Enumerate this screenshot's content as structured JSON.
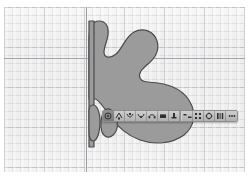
{
  "app": {
    "kind": "vector-drawing-canvas",
    "background_color": "#ffffff",
    "canvas_color": "#eeeeee"
  },
  "canvas": {
    "grid": {
      "visible": true,
      "minor_spacing_px": 8,
      "major_spacing_px": 40,
      "minor_color": "#b0b4ba",
      "major_color": "#9ea3aa"
    },
    "guides": [
      {
        "name": "vertical-guide",
        "orientation": "vertical",
        "position_px": 82,
        "color": "#9a9ea4"
      },
      {
        "name": "horizontal-guide",
        "orientation": "horizontal",
        "position_px": 51,
        "color": "#a2a6ac"
      }
    ]
  },
  "artwork": {
    "name": "blob-shape",
    "description": "large organic multi-lobed blob",
    "fill_color": "#9b9b9b",
    "stroke_color": "#4a4a4a",
    "stroke_width": 1.2,
    "selected": true,
    "path": "M 85 33 C 85 22, 88 14, 95 14 C 102 14, 105 20, 104 28 C 103 35, 100 40, 100 45 C 100 51, 106 52, 112 47 C 119 41, 121 30, 130 25 C 139 20, 150 24, 153 34 C 156 44, 150 52, 144 57 C 138 62, 134 66, 136 71 C 138 76, 146 75, 154 76 C 168 78, 180 84, 186 95 C 193 107, 190 120, 180 128 C 168 137, 150 138, 136 133 C 122 128, 112 118, 105 108 C 99 99, 94 92, 91 92 L 85 92 Z",
    "lobes": [
      {
        "name": "lower-lobe-left",
        "path": "M 85 108 C 85 104, 86 101, 89 101 C 93 101, 96 107, 96 115 C 96 126, 93 133, 89 133 C 86 133, 85 129, 85 124 Z"
      },
      {
        "name": "lower-lobe-right",
        "path": "M 99 107 C 102 103, 107 104, 110 109 C 114 116, 113 125, 108 129 C 104 133, 99 131, 97 126 C 95 120, 96 112, 99 107 Z"
      }
    ]
  },
  "context_toolbar": {
    "name": "floating-context-toolbar",
    "visible": true,
    "background_color": "#b9b9b9",
    "border_color": "#8e8e8e",
    "buttons": [
      {
        "icon": "target-anchor-icon",
        "label": "Anchor point",
        "active": true
      },
      {
        "icon": "convert-point-icon",
        "label": "Convert anchor point",
        "active": false
      },
      {
        "icon": "cut-path-icon",
        "label": "Cut path at point",
        "active": false
      },
      {
        "icon": "join-path-icon",
        "label": "Join path",
        "active": false
      },
      {
        "icon": "smooth-point-icon",
        "label": "Smooth point",
        "active": false
      },
      {
        "icon": "corner-point-icon",
        "label": "Corner point",
        "active": false
      },
      {
        "icon": "isolate-object-icon",
        "label": "Isolate selection",
        "active": false
      },
      {
        "icon": "align-horizontal-icon",
        "label": "Align horizontal",
        "active": false
      },
      {
        "icon": "distribute-icon",
        "label": "Distribute objects",
        "active": false
      },
      {
        "icon": "transform-icon",
        "label": "Transform",
        "active": false
      },
      {
        "icon": "arrange-icon",
        "label": "Arrange",
        "active": false
      },
      {
        "icon": "more-options-icon",
        "label": "More options",
        "active": false
      }
    ]
  }
}
